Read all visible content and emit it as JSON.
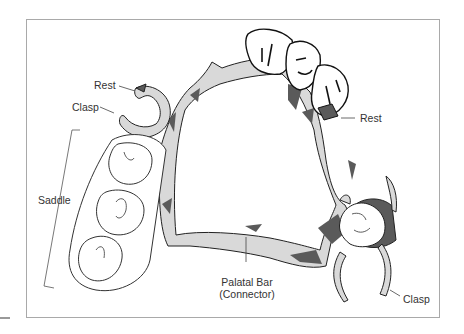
{
  "figure": {
    "colors": {
      "frame": "#a9a9a9",
      "metal_light": "#d9d9d9",
      "metal_dark": "#5a5a5a",
      "outline": "#222222",
      "label_text": "#333333",
      "leader_line": "#444444"
    }
  },
  "labels": {
    "rest_left": "Rest",
    "clasp_left": "Clasp",
    "rest_right": "Rest",
    "saddle": "Saddle",
    "palatal_bar_line1": "Palatal Bar",
    "palatal_bar_line2": "(Connector)",
    "clasp_right": "Clasp"
  }
}
